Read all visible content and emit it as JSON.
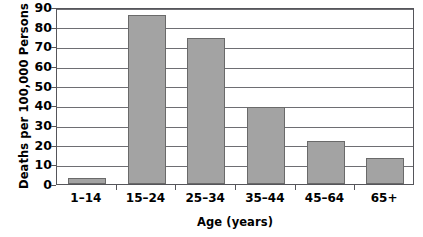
{
  "chart_data": {
    "type": "bar",
    "title": "",
    "subtitle": "",
    "xlabel": "Age (years)",
    "ylabel": "Deaths per 100,000 Persons",
    "categories": [
      "1–14",
      "15–24",
      "25–34",
      "35–44",
      "45–64",
      "65+"
    ],
    "values": [
      3,
      86,
      74,
      39,
      22,
      13
    ],
    "series": [
      {
        "name": "Deaths per 100,000 Persons",
        "values": [
          3,
          86,
          74,
          39,
          22,
          13
        ]
      }
    ],
    "ylim": [
      0,
      90
    ],
    "xlim": null,
    "ytick_values": [
      0,
      10,
      20,
      30,
      40,
      50,
      60,
      70,
      80,
      90
    ],
    "ytick_labels": [
      "0",
      "10",
      "20",
      "30",
      "40",
      "50",
      "60",
      "70",
      "80",
      "90"
    ],
    "xtick_labels": [
      "1–14",
      "15–24",
      "25–34",
      "35–44",
      "45–64",
      "65+"
    ],
    "grid": true,
    "grid_axis": "y",
    "legend": false,
    "legend_position": "none",
    "annotations": [],
    "colors": {
      "bar_fill": "#a3a3a3",
      "bar_stroke": "#6a6a6a",
      "gridline": "#6e6e73",
      "axis": "#55555a",
      "text": "#000000",
      "background": "#ffffff"
    }
  }
}
